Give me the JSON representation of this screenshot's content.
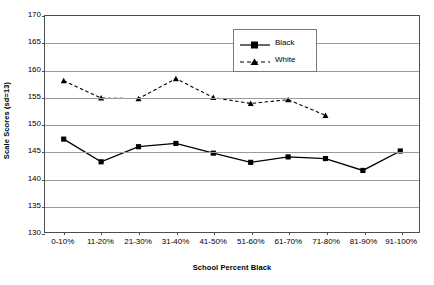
{
  "chart_data": {
    "type": "line",
    "title": "",
    "xlabel": "School Percent Black",
    "ylabel": "Scale Scores (sd=13)",
    "categories": [
      "0-10%",
      "11-20%",
      "21-30%",
      "31-40%",
      "41-50%",
      "51-60%",
      "61-70%",
      "71-80%",
      "81-90%",
      "91-100%"
    ],
    "ylim": [
      130,
      170
    ],
    "yticks": [
      130,
      135,
      140,
      145,
      150,
      155,
      160,
      165,
      170
    ],
    "ytick_labels": [
      "130",
      "135",
      "140",
      "145",
      "150",
      "155",
      "160",
      "165",
      "170"
    ],
    "grid": true,
    "legend_position": "top-center-right",
    "series": [
      {
        "name": "Black",
        "marker": "square",
        "line_style": "solid",
        "color": "#000000",
        "values": [
          147.2,
          143.0,
          145.8,
          146.4,
          144.6,
          142.9,
          143.9,
          143.6,
          141.4,
          145.0
        ]
      },
      {
        "name": "White",
        "marker": "triangle",
        "line_style": "dashed",
        "color": "#000000",
        "values": [
          158.0,
          154.8,
          154.7,
          158.4,
          154.9,
          153.8,
          154.5,
          151.6,
          null,
          null
        ]
      }
    ]
  },
  "legend": {
    "entries": [
      {
        "label": "Black"
      },
      {
        "label": "White"
      }
    ]
  },
  "colors": {
    "axis": "#4d4d4d",
    "grid": "#9a9a9a",
    "series": "#000000",
    "background": "#ffffff"
  }
}
